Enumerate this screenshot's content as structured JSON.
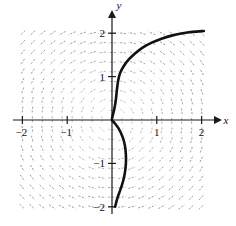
{
  "figure": {
    "kind": "slope-field-with-solution-curve",
    "background_color": "#ffffff",
    "axis_color": "#1a1a1a",
    "slope_field_color": "#8a8a8a",
    "curve_color": "#111111"
  },
  "chart_data": {
    "type": "scatter",
    "title": "",
    "subtitle": "",
    "xlabel": "x",
    "ylabel": "y",
    "xlim": [
      -2.15,
      2.15
    ],
    "ylim": [
      -2.15,
      2.15
    ],
    "grid": false,
    "legend": null,
    "axes": {
      "x_axis_label": "x",
      "y_axis_label": "y",
      "x_ticks": [
        -2,
        -1,
        1,
        2
      ],
      "x_tick_labels": [
        "-2",
        "-1",
        "1",
        "2"
      ],
      "y_ticks": [
        -2,
        -1,
        1,
        2
      ],
      "y_tick_labels": [
        "-2",
        "-1",
        "1",
        "2"
      ],
      "x_axis_arrow": true,
      "y_axis_arrow": true,
      "origin_labeled": false
    },
    "slope_field": {
      "description": "short dashed line segments showing direction field, swirling about the origin",
      "x_start": -2.0,
      "x_end": 2.0,
      "y_start": -2.0,
      "y_end": 2.0,
      "x_step": 0.2222,
      "y_step": 0.2222,
      "segment_half_length": 0.085,
      "color": "#8a8a8a",
      "slope_formula": "dy/dx = -x/y style rotational field; segments tangent to circles centered at origin, near-vertical far from x-axis on the left and right and near-horizontal close to the x-axis"
    },
    "series": [
      {
        "name": "solution curve",
        "color": "#111111",
        "line_width": 2.6,
        "description": "S-shaped (sigmoid-like) solution passing through the origin; rises steeply from (0,0) toward y=1 near x=0.15, bends right and flattens at about y=2.05 by x=2; below the origin it bulges right to about x=0.30 near y=-1 then returns toward x=0.06 at y=-2",
        "points": [
          [
            0.07,
            -2.0
          ],
          [
            0.12,
            -1.8
          ],
          [
            0.19,
            -1.6
          ],
          [
            0.25,
            -1.4
          ],
          [
            0.29,
            -1.2
          ],
          [
            0.31,
            -1.0
          ],
          [
            0.31,
            -0.8
          ],
          [
            0.29,
            -0.6
          ],
          [
            0.24,
            -0.4
          ],
          [
            0.15,
            -0.2
          ],
          [
            0.05,
            -0.06
          ],
          [
            0.0,
            0.0
          ],
          [
            0.02,
            0.12
          ],
          [
            0.06,
            0.3
          ],
          [
            0.09,
            0.5
          ],
          [
            0.11,
            0.7
          ],
          [
            0.14,
            0.92
          ],
          [
            0.18,
            1.08
          ],
          [
            0.26,
            1.24
          ],
          [
            0.38,
            1.4
          ],
          [
            0.52,
            1.54
          ],
          [
            0.7,
            1.68
          ],
          [
            0.9,
            1.79
          ],
          [
            1.12,
            1.88
          ],
          [
            1.35,
            1.95
          ],
          [
            1.58,
            2.0
          ],
          [
            1.8,
            2.03
          ],
          [
            2.05,
            2.05
          ]
        ]
      }
    ]
  }
}
